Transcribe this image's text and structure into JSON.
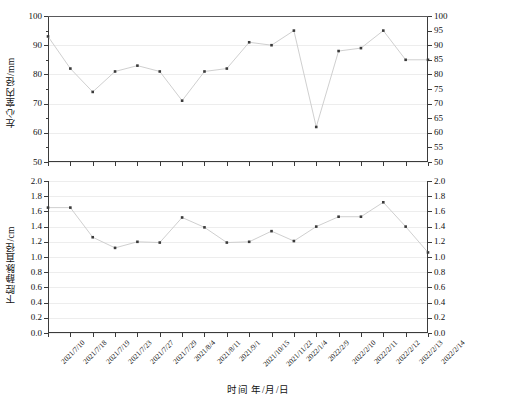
{
  "figure": {
    "xlabel": "时间 年/月/日",
    "background": "#ffffff",
    "line_color": "#c9c9c9",
    "marker_color": "#3a3a3a",
    "grid_color": "#f0f0f0"
  },
  "chart_data": [
    {
      "type": "line",
      "panel": "top",
      "title": "",
      "ylabel": "左心室内径/mm",
      "xlabel": "时间 年/月/日",
      "ylim": [
        50,
        100
      ],
      "ytick_labels_left": [
        "50",
        "60",
        "70",
        "80",
        "90",
        "100"
      ],
      "ytick_values_left": [
        50,
        60,
        70,
        80,
        90,
        100
      ],
      "ytick_labels_right": [
        "50",
        "55",
        "60",
        "65",
        "70",
        "75",
        "80",
        "85",
        "90",
        "95",
        "100"
      ],
      "ytick_values_right": [
        50,
        55,
        60,
        65,
        70,
        75,
        80,
        85,
        90,
        95,
        100
      ],
      "grid": true,
      "legend": "none",
      "categories": [
        "2021/7/10",
        "2021/7/18",
        "2021/7/19",
        "2021/7/23",
        "2021/7/27",
        "2021/7/29",
        "2021/8/4",
        "2021/8/11",
        "2021/9/1",
        "2021/10/15",
        "2021/11/22",
        "2022/1/4",
        "2022/2/9",
        "2022/2/10",
        "2022/2/11",
        "2022/2/12",
        "2022/2/13",
        "2022/2/14"
      ],
      "values": [
        93,
        82,
        74,
        81,
        83,
        81,
        71,
        81,
        82,
        91,
        90,
        95,
        62,
        88,
        89,
        95,
        85,
        85
      ]
    },
    {
      "type": "line",
      "panel": "bottom",
      "title": "",
      "ylabel": "下腔静脉直径/cm",
      "xlabel": "时间 年/月/日",
      "ylim": [
        0.0,
        2.0
      ],
      "ytick_labels_left": [
        "0.0",
        "0.2",
        "0.4",
        "0.6",
        "0.8",
        "1.0",
        "1.2",
        "1.4",
        "1.6",
        "1.8",
        "2.0"
      ],
      "ytick_values_left": [
        0.0,
        0.2,
        0.4,
        0.6,
        0.8,
        1.0,
        1.2,
        1.4,
        1.6,
        1.8,
        2.0
      ],
      "ytick_labels_right": [
        "0.0",
        "0.2",
        "0.4",
        "0.6",
        "0.8",
        "1.0",
        "1.2",
        "1.4",
        "1.6",
        "1.8",
        "2.0"
      ],
      "ytick_values_right": [
        0.0,
        0.2,
        0.4,
        0.6,
        0.8,
        1.0,
        1.2,
        1.4,
        1.6,
        1.8,
        2.0
      ],
      "grid": true,
      "legend": "none",
      "categories": [
        "2021/7/10",
        "2021/7/18",
        "2021/7/19",
        "2021/7/23",
        "2021/7/27",
        "2021/7/29",
        "2021/8/4",
        "2021/8/11",
        "2021/9/1",
        "2021/10/15",
        "2021/11/22",
        "2022/1/4",
        "2022/2/9",
        "2022/2/10",
        "2022/2/11",
        "2022/2/12",
        "2022/2/13",
        "2022/2/14"
      ],
      "values": [
        1.65,
        1.65,
        1.26,
        1.12,
        1.2,
        1.19,
        1.52,
        1.39,
        1.19,
        1.2,
        1.34,
        1.21,
        1.4,
        1.53,
        1.53,
        1.72,
        1.4,
        1.06
      ]
    }
  ]
}
